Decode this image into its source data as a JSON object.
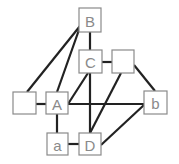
{
  "diagram": {
    "type": "graph",
    "nodes": [
      {
        "id": "B",
        "label": "B"
      },
      {
        "id": "C",
        "label": "C"
      },
      {
        "id": "R",
        "label": ""
      },
      {
        "id": "L",
        "label": ""
      },
      {
        "id": "A",
        "label": "A"
      },
      {
        "id": "b",
        "label": "b"
      },
      {
        "id": "a",
        "label": "a"
      },
      {
        "id": "D",
        "label": "D"
      }
    ],
    "edges": [
      {
        "from": "B",
        "to": "L"
      },
      {
        "from": "B",
        "to": "A"
      },
      {
        "from": "B",
        "to": "C"
      },
      {
        "from": "C",
        "to": "R"
      },
      {
        "from": "C",
        "to": "A"
      },
      {
        "from": "C",
        "to": "D"
      },
      {
        "from": "R",
        "to": "b"
      },
      {
        "from": "R",
        "to": "D"
      },
      {
        "from": "L",
        "to": "A"
      },
      {
        "from": "A",
        "to": "b"
      },
      {
        "from": "A",
        "to": "a"
      },
      {
        "from": "a",
        "to": "D"
      },
      {
        "from": "D",
        "to": "b"
      }
    ],
    "colors": {
      "edge": "#222222",
      "box_border": "#8a8a8a",
      "label": "#8a8a8a"
    }
  }
}
